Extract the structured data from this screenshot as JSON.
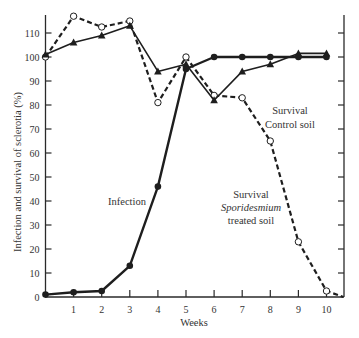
{
  "chart_data": {
    "type": "line",
    "title": "",
    "xlabel": "Weeks",
    "ylabel": "Infection and survival of sclerotia (%)",
    "x": [
      0,
      1,
      2,
      3,
      4,
      5,
      6,
      7,
      8,
      9,
      10
    ],
    "x_ticks": [
      "1",
      "2",
      "3",
      "4",
      "5",
      "6",
      "7",
      "8",
      "9",
      "10"
    ],
    "y_ticks": [
      "0",
      "10",
      "20",
      "30",
      "40",
      "50",
      "60",
      "70",
      "80",
      "90",
      "100",
      "110"
    ],
    "xlim": [
      0,
      10.6
    ],
    "ylim": [
      0,
      118
    ],
    "grid": false,
    "series": [
      {
        "name": "Infection",
        "marker": "filled-circle",
        "line": "solid",
        "x": [
          0,
          1,
          2,
          3,
          4,
          5,
          6,
          7,
          8,
          9,
          10
        ],
        "values": [
          1,
          2,
          2.5,
          13,
          46,
          95,
          100,
          100,
          100,
          100,
          100
        ]
      },
      {
        "name": "Survival Control soil",
        "marker": "filled-triangle",
        "line": "solid",
        "x": [
          0,
          1,
          2,
          3,
          4,
          5,
          6,
          7,
          8,
          9,
          10
        ],
        "values": [
          101,
          106,
          109,
          113,
          94,
          97,
          82,
          94,
          97,
          101.5,
          101.5
        ]
      },
      {
        "name": "Survival Sporidesmium treated soil",
        "marker": "open-circle",
        "line": "dashed",
        "x": [
          0,
          1,
          2,
          3,
          4,
          5,
          6,
          7,
          8,
          9,
          10,
          10.6
        ],
        "values": [
          100,
          117,
          112.5,
          115,
          81,
          100,
          84,
          83,
          65,
          23,
          2.5,
          0
        ]
      }
    ],
    "annotations": [
      {
        "text": "Infection",
        "near_series": "Infection"
      },
      {
        "text": "Survival",
        "line2": "Control soil",
        "near_series": "Survival Control soil"
      },
      {
        "text": "Survival",
        "line2_italic": "Sporidesmium",
        "line3": "treated soil",
        "near_series": "Survival Sporidesmium treated soil"
      }
    ]
  },
  "labels": {
    "xlabel": "Weeks",
    "ylabel": "Infection and survival of sclerotia (%)",
    "infection": "Infection",
    "control_line1": "Survival",
    "control_line2": "Control soil",
    "treated_line1": "Survival",
    "treated_line2": "Sporidesmium",
    "treated_line3": "treated soil"
  }
}
